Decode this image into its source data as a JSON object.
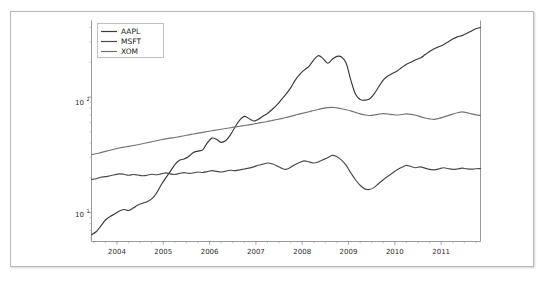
{
  "figure": {
    "background_color": "#ffffff",
    "frame_color": "#b9b9b9"
  },
  "chart_data": {
    "type": "line",
    "title": "",
    "xlabel": "",
    "ylabel": "",
    "yscale": "log",
    "xlim": [
      2003.45,
      2011.85
    ],
    "ylim": [
      5.6,
      460
    ],
    "grid": false,
    "legend_position": "upper left",
    "y_tick_labels": [
      "10¹",
      "10²"
    ],
    "y_tick_values": [
      10,
      100
    ],
    "x_tick_labels": [
      "2004",
      "2005",
      "2006",
      "2007",
      "2008",
      "2009",
      "2010",
      "2011"
    ],
    "x_tick_values": [
      2004,
      2005,
      2006,
      2007,
      2008,
      2009,
      2010,
      2011
    ],
    "series": [
      {
        "name": "AAPL",
        "color": "#3a3a3a",
        "x": [
          2003.45,
          2003.55,
          2003.65,
          2003.75,
          2003.85,
          2003.95,
          2004.05,
          2004.15,
          2004.25,
          2004.35,
          2004.45,
          2004.55,
          2004.65,
          2004.75,
          2004.85,
          2004.95,
          2005.05,
          2005.15,
          2005.25,
          2005.35,
          2005.45,
          2005.55,
          2005.65,
          2005.75,
          2005.85,
          2005.95,
          2006.05,
          2006.15,
          2006.25,
          2006.35,
          2006.45,
          2006.55,
          2006.65,
          2006.75,
          2006.85,
          2006.95,
          2007.05,
          2007.15,
          2007.25,
          2007.35,
          2007.45,
          2007.55,
          2007.65,
          2007.75,
          2007.85,
          2007.95,
          2008.05,
          2008.15,
          2008.25,
          2008.35,
          2008.45,
          2008.55,
          2008.65,
          2008.75,
          2008.85,
          2008.95,
          2009.05,
          2009.15,
          2009.25,
          2009.35,
          2009.45,
          2009.55,
          2009.65,
          2009.75,
          2009.85,
          2009.95,
          2010.05,
          2010.15,
          2010.25,
          2010.35,
          2010.45,
          2010.55,
          2010.65,
          2010.75,
          2010.85,
          2010.95,
          2011.05,
          2011.15,
          2011.25,
          2011.35,
          2011.45,
          2011.55,
          2011.65,
          2011.75,
          2011.85
        ],
        "y": [
          6.4,
          6.8,
          7.6,
          8.6,
          9.2,
          9.7,
          10.3,
          10.6,
          10.4,
          10.9,
          11.6,
          12.0,
          12.4,
          13.1,
          14.6,
          17.2,
          19.8,
          22.6,
          26.0,
          28.3,
          29.0,
          30.5,
          33.0,
          34.0,
          34.8,
          40.0,
          44.0,
          43.0,
          40.5,
          42.0,
          47.0,
          55.0,
          63.0,
          68.0,
          65.0,
          62.0,
          64.0,
          68.0,
          72.0,
          78.0,
          85.0,
          95.0,
          106.0,
          120.0,
          140.0,
          158.0,
          172.0,
          185.0,
          210.0,
          228.0,
          215.0,
          196.0,
          212.0,
          225.0,
          222.0,
          196.0,
          140.0,
          106.0,
          95.0,
          94.0,
          96.0,
          106.0,
          122.0,
          140.0,
          152.0,
          160.0,
          168.0,
          180.0,
          192.0,
          200.0,
          210.0,
          218.0,
          232.0,
          248.0,
          262.0,
          272.0,
          284.0,
          300.0,
          318.0,
          332.0,
          340.0,
          355.0,
          372.0,
          390.0,
          400.0
        ]
      },
      {
        "name": "MSFT",
        "color": "#4a4a4a",
        "x": [
          2003.45,
          2003.55,
          2003.65,
          2003.75,
          2003.85,
          2003.95,
          2004.05,
          2004.15,
          2004.25,
          2004.35,
          2004.45,
          2004.55,
          2004.65,
          2004.75,
          2004.85,
          2004.95,
          2005.05,
          2005.15,
          2005.25,
          2005.35,
          2005.45,
          2005.55,
          2005.65,
          2005.75,
          2005.85,
          2005.95,
          2006.05,
          2006.15,
          2006.25,
          2006.35,
          2006.45,
          2006.55,
          2006.65,
          2006.75,
          2006.85,
          2006.95,
          2007.05,
          2007.15,
          2007.25,
          2007.35,
          2007.45,
          2007.55,
          2007.65,
          2007.75,
          2007.85,
          2007.95,
          2008.05,
          2008.15,
          2008.25,
          2008.35,
          2008.45,
          2008.55,
          2008.65,
          2008.75,
          2008.85,
          2008.95,
          2009.05,
          2009.15,
          2009.25,
          2009.35,
          2009.45,
          2009.55,
          2009.65,
          2009.75,
          2009.85,
          2009.95,
          2010.05,
          2010.15,
          2010.25,
          2010.35,
          2010.45,
          2010.55,
          2010.65,
          2010.75,
          2010.85,
          2010.95,
          2011.05,
          2011.15,
          2011.25,
          2011.35,
          2011.45,
          2011.55,
          2011.65,
          2011.75,
          2011.85
        ],
        "y": [
          19.3,
          19.6,
          20.2,
          20.4,
          20.8,
          21.2,
          21.6,
          21.4,
          21.0,
          21.3,
          21.1,
          20.8,
          21.0,
          21.4,
          21.2,
          21.6,
          22.0,
          21.6,
          21.3,
          21.8,
          22.1,
          21.8,
          22.0,
          22.4,
          22.2,
          22.6,
          23.0,
          22.7,
          22.4,
          22.8,
          23.2,
          23.0,
          23.4,
          23.8,
          24.2,
          24.8,
          25.6,
          26.2,
          26.8,
          26.4,
          25.4,
          24.2,
          23.6,
          24.6,
          26.0,
          27.2,
          28.0,
          27.4,
          26.8,
          27.4,
          28.6,
          29.8,
          31.2,
          30.4,
          28.4,
          25.6,
          22.0,
          19.2,
          17.2,
          16.0,
          15.8,
          16.4,
          17.8,
          19.2,
          20.6,
          22.0,
          23.4,
          24.6,
          25.6,
          25.0,
          24.4,
          24.8,
          24.2,
          23.6,
          23.4,
          23.8,
          24.4,
          24.0,
          23.6,
          23.8,
          24.2,
          23.9,
          23.7,
          23.9,
          24.0
        ]
      },
      {
        "name": "XOM",
        "color": "#737373",
        "x": [
          2003.45,
          2003.55,
          2003.65,
          2003.75,
          2003.85,
          2003.95,
          2004.05,
          2004.15,
          2004.25,
          2004.35,
          2004.45,
          2004.55,
          2004.65,
          2004.75,
          2004.85,
          2004.95,
          2005.05,
          2005.15,
          2005.25,
          2005.35,
          2005.45,
          2005.55,
          2005.65,
          2005.75,
          2005.85,
          2005.95,
          2006.05,
          2006.15,
          2006.25,
          2006.35,
          2006.45,
          2006.55,
          2006.65,
          2006.75,
          2006.85,
          2006.95,
          2007.05,
          2007.15,
          2007.25,
          2007.35,
          2007.45,
          2007.55,
          2007.65,
          2007.75,
          2007.85,
          2007.95,
          2008.05,
          2008.15,
          2008.25,
          2008.35,
          2008.45,
          2008.55,
          2008.65,
          2008.75,
          2008.85,
          2008.95,
          2009.05,
          2009.15,
          2009.25,
          2009.35,
          2009.45,
          2009.55,
          2009.65,
          2009.75,
          2009.85,
          2009.95,
          2010.05,
          2010.15,
          2010.25,
          2010.35,
          2010.45,
          2010.55,
          2010.65,
          2010.75,
          2010.85,
          2010.95,
          2011.05,
          2011.15,
          2011.25,
          2011.35,
          2011.45,
          2011.55,
          2011.65,
          2011.75,
          2011.85
        ],
        "y": [
          31.6,
          32.2,
          33.0,
          33.8,
          34.6,
          35.4,
          36.2,
          36.8,
          37.4,
          38.0,
          38.6,
          39.4,
          40.2,
          41.0,
          41.8,
          42.6,
          43.4,
          44.0,
          44.6,
          45.4,
          46.2,
          47.0,
          47.8,
          48.6,
          49.4,
          50.2,
          51.0,
          51.8,
          52.6,
          53.4,
          54.2,
          55.0,
          55.8,
          56.6,
          57.4,
          58.4,
          59.4,
          60.4,
          61.4,
          62.6,
          63.8,
          65.0,
          66.4,
          68.0,
          69.6,
          71.4,
          73.0,
          74.6,
          76.4,
          78.0,
          79.6,
          80.8,
          81.4,
          80.6,
          79.2,
          77.6,
          75.8,
          73.6,
          71.4,
          70.0,
          69.2,
          69.8,
          71.0,
          71.8,
          71.2,
          70.4,
          69.8,
          70.6,
          71.4,
          70.8,
          69.4,
          67.6,
          65.8,
          64.6,
          64.0,
          65.2,
          67.0,
          69.0,
          71.0,
          73.0,
          74.4,
          73.2,
          71.4,
          70.0,
          69.2
        ]
      }
    ]
  },
  "legend": {
    "entries": [
      {
        "label": "AAPL"
      },
      {
        "label": "MSFT"
      },
      {
        "label": "XOM"
      }
    ]
  },
  "axes": {
    "y_label_upper": "10",
    "y_label_upper_exp": "2",
    "y_label_lower": "10",
    "y_label_lower_exp": "1"
  }
}
